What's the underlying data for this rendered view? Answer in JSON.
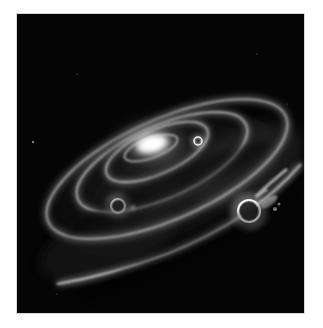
{
  "image": {
    "subject": "Spiral galaxy with bright core, curved spiral arms, and two glowing ring-shaped bright regions",
    "palette": {
      "background": "#050505",
      "core": "#ffffff",
      "arm_glow": "#cfcfcf",
      "dust": "#3a3a3a",
      "page": "#ffffff"
    },
    "features": [
      {
        "name": "galactic-core",
        "cx": 130,
        "cy": 130
      },
      {
        "name": "inner-ring-knot",
        "cx": 181,
        "cy": 127
      },
      {
        "name": "left-ring-knot",
        "cx": 101,
        "cy": 192
      },
      {
        "name": "right-ring-knot",
        "cx": 232,
        "cy": 197
      }
    ]
  }
}
